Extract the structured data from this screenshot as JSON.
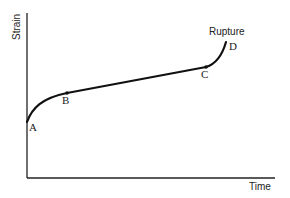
{
  "diagram": {
    "type": "creep-curve",
    "axes": {
      "y_label": "Strain",
      "x_label": "Time"
    },
    "points": [
      {
        "id": "A",
        "label": "A"
      },
      {
        "id": "B",
        "label": "B"
      },
      {
        "id": "C",
        "label": "C"
      },
      {
        "id": "D",
        "label": "D"
      }
    ],
    "annotation": "Rupture",
    "colors": {
      "line": "#111111",
      "axis": "#222222",
      "background": "#ffffff"
    }
  }
}
